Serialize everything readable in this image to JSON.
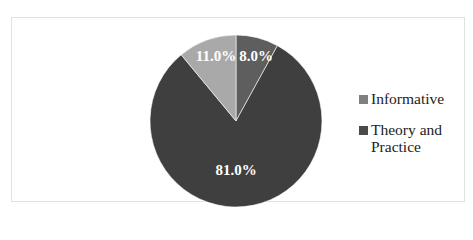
{
  "chart_data": {
    "type": "pie",
    "title": "",
    "slices": [
      {
        "name": "Informative",
        "value": 8.0,
        "label": "8.0%",
        "color": "#5e5e5e"
      },
      {
        "name": "Theory and Practice",
        "value": 81.0,
        "label": "81.0%",
        "color": "#3f3f3f"
      },
      {
        "name": "",
        "value": 11.0,
        "label": "11.0%",
        "color": "#a9a9a9"
      }
    ],
    "legend": {
      "position": "right",
      "entries": [
        {
          "label": "Informative",
          "color": "#808080"
        },
        {
          "label": "Theory and Practice",
          "color": "#4a4a4a"
        }
      ]
    }
  }
}
